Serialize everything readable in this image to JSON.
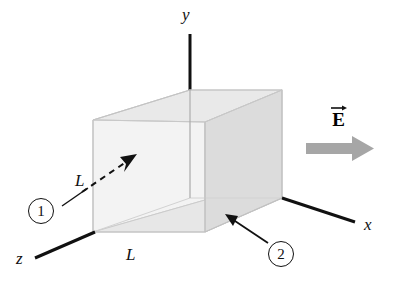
{
  "figure": {
    "axes": [
      {
        "name": "y-axis",
        "label": "y"
      },
      {
        "name": "x-axis",
        "label": "x"
      },
      {
        "name": "z-axis",
        "label": "z"
      }
    ],
    "axis_labels": {
      "y": "y",
      "x": "x",
      "z": "z"
    },
    "edge_labels": {
      "left": "L",
      "bottom": "L"
    },
    "field": {
      "label": "E",
      "vector_notation": "arrow-over",
      "direction": "+x",
      "arrow_color": "#a6a6a6"
    },
    "callouts": [
      {
        "id": "1",
        "label": "1",
        "target": "left face (x = 0, normal -x)"
      },
      {
        "id": "2",
        "label": "2",
        "target": "bottom face (y = 0, normal -y)"
      }
    ],
    "colors": {
      "axis": "#111111",
      "cube_top": "#ececec",
      "cube_front": "#f2f2f2",
      "cube_right": "#dcdcdc",
      "cube_bottom": "#e6e6e6",
      "cube_edge": "#c9c9c9",
      "arrow_dark": "#111111",
      "field_arrow": "#a6a6a6",
      "background": "#ffffff"
    }
  }
}
